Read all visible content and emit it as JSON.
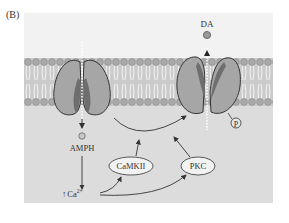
{
  "panel_label": "(B)",
  "labels": {
    "da": "DA",
    "amph": "AMPH",
    "camkii": "CaMKII",
    "pkc": "PKC",
    "phospho": "P",
    "calcium_arrow": "↑",
    "calcium": "Ca",
    "calcium_charge": "2+"
  },
  "colors": {
    "background_extracellular": "#f1f1f1",
    "background_intracellular": "#dedede",
    "membrane": "#c4c4c4",
    "lipid_head": "#a8a8a8",
    "transporter": "#a5a5a5",
    "transporter_inner": "#6e6e6e",
    "outline": "#333333"
  }
}
